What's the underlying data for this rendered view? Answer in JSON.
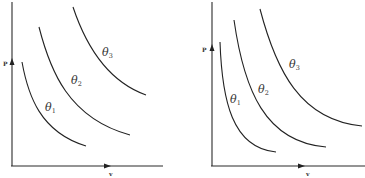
{
  "figure": {
    "panels": [
      {
        "id": "left",
        "y_axis_label": "P",
        "x_axis_label": "v",
        "curves": [
          {
            "label": "θ",
            "subscript": "1"
          },
          {
            "label": "θ",
            "subscript": "2"
          },
          {
            "label": "θ",
            "subscript": "3"
          }
        ]
      },
      {
        "id": "right",
        "y_axis_label": "P",
        "x_axis_label": "v",
        "curves": [
          {
            "label": "θ",
            "subscript": "1"
          },
          {
            "label": "θ",
            "subscript": "2"
          },
          {
            "label": "θ",
            "subscript": "3"
          }
        ]
      }
    ],
    "colors": {
      "ink": "#222222",
      "background": "#ffffff"
    }
  }
}
